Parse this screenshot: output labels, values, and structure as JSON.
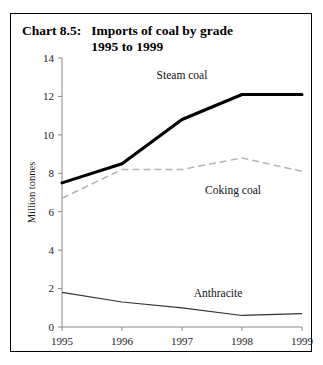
{
  "title": {
    "number": "Chart 8.5:",
    "line1": "Imports of coal by grade",
    "line2": "1995 to 1999"
  },
  "chart_data": {
    "type": "line",
    "title": "Imports of coal by grade 1995 to 1999",
    "subtitle": "",
    "xlabel": "",
    "ylabel": "Million tonnes",
    "categories": [
      "1995",
      "1996",
      "1997",
      "1998",
      "1999"
    ],
    "x": [
      1995,
      1996,
      1997,
      1998,
      1999
    ],
    "xlim": [
      1995,
      1999
    ],
    "ylim": [
      0,
      14
    ],
    "yticks": [
      0,
      2,
      4,
      6,
      8,
      10,
      12,
      14
    ],
    "ytick_labels": [
      "0",
      "2",
      "4",
      "6",
      "8",
      "10",
      "12",
      "14"
    ],
    "xticks": [
      1995,
      1996,
      1997,
      1998,
      1999
    ],
    "xtick_labels": [
      "1995",
      "1996",
      "1997",
      "1998",
      "1999"
    ],
    "grid": false,
    "legend": "inline-annotations",
    "series": [
      {
        "name": "Steam coal",
        "label": "Steam coal",
        "color": "#000000",
        "style": "solid-thick",
        "values": [
          7.5,
          8.5,
          10.8,
          12.1,
          12.1
        ],
        "label_x": 1997.0,
        "label_y": 12.9
      },
      {
        "name": "Coking coal",
        "label": "Coking coal",
        "color": "#b3b3b3",
        "style": "dashed",
        "values": [
          6.7,
          8.2,
          8.2,
          8.8,
          8.1
        ],
        "label_x": 1997.85,
        "label_y": 6.9
      },
      {
        "name": "Anthracite",
        "label": "Anthracite",
        "color": "#333333",
        "style": "solid-thin",
        "values": [
          1.8,
          1.3,
          1.0,
          0.6,
          0.7
        ],
        "label_x": 1997.6,
        "label_y": 1.55
      }
    ]
  }
}
